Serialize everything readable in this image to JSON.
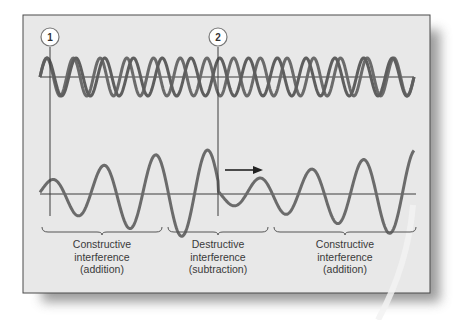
{
  "figure": {
    "markers": [
      {
        "id": "1",
        "x": 50
      },
      {
        "id": "2",
        "x": 218
      }
    ],
    "regions": [
      {
        "line1": "Constructive",
        "line2": "interference",
        "line3": "(addition)",
        "x1": 42,
        "x2": 162
      },
      {
        "line1": "Destructive",
        "line2": "interference",
        "line3": "(subtraction)",
        "x1": 168,
        "x2": 268
      },
      {
        "line1": "Constructive",
        "line2": "interference",
        "line3": "(addition)",
        "x1": 274,
        "x2": 416
      }
    ],
    "arrow": {
      "direction": "right"
    },
    "colors": {
      "panel": "#e8e8e8",
      "border": "#4a4a4a",
      "wave": "#6b6b6b",
      "axis": "#3c3c3c",
      "text": "#3a3a3a",
      "shadow": "#8a8a8a"
    }
  }
}
